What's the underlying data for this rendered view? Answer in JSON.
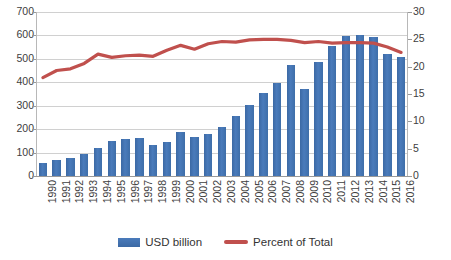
{
  "chart_data": {
    "type": "bar",
    "title": "",
    "subtitle": "",
    "xlabel": "",
    "ylabel": "",
    "y2label": "",
    "categories": [
      "1990",
      "1991",
      "1992",
      "1993",
      "1994",
      "1995",
      "1996",
      "1997",
      "1998",
      "1999",
      "2000",
      "2001",
      "2002",
      "2003",
      "2004",
      "2005",
      "2006",
      "2007",
      "2008",
      "2009",
      "2010",
      "2011",
      "2012",
      "2013",
      "2014",
      "2015",
      "2016"
    ],
    "series": [
      {
        "name": "USD billion",
        "type": "bar",
        "axis": "left",
        "color": "#4472A8",
        "values": [
          55,
          68,
          77,
          92,
          120,
          149,
          158,
          161,
          132,
          147,
          187,
          166,
          178,
          208,
          256,
          304,
          353,
          398,
          472,
          371,
          487,
          557,
          596,
          603,
          595,
          522,
          508
        ]
      },
      {
        "name": "Percent of Total",
        "type": "line",
        "axis": "right",
        "color": "#C0504D",
        "values": [
          18.0,
          19.3,
          19.6,
          20.6,
          22.3,
          21.7,
          22.0,
          22.1,
          21.9,
          23.0,
          23.9,
          23.2,
          24.2,
          24.6,
          24.5,
          24.9,
          25.0,
          25.0,
          24.8,
          24.4,
          24.6,
          24.3,
          24.4,
          24.4,
          24.3,
          23.6,
          22.6
        ]
      }
    ],
    "ylim": [
      0,
      700
    ],
    "yticks": [
      0,
      100,
      200,
      300,
      400,
      500,
      600,
      700
    ],
    "y2lim": [
      0,
      30
    ],
    "y2ticks": [
      0,
      5,
      10,
      15,
      20,
      25,
      30
    ],
    "grid": true,
    "legend_position": "bottom"
  },
  "legend": {
    "items": [
      {
        "label": "USD billion",
        "marker": "bar-swatch",
        "color": "#4472A8"
      },
      {
        "label": "Percent of Total",
        "marker": "line-swatch",
        "color": "#C0504D"
      }
    ]
  }
}
